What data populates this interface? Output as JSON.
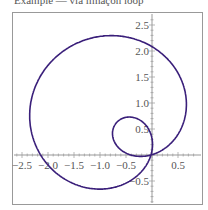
{
  "caption": "Example — via limaçon loop",
  "chart_data": {
    "type": "line",
    "title": "",
    "xlabel": "",
    "ylabel": "",
    "xlim": [
      -2.6,
      0.9
    ],
    "ylim": [
      -1.0,
      2.7
    ],
    "grid": false,
    "x_ticks": [
      -2.5,
      -2.0,
      -1.5,
      -1.0,
      -0.5,
      0.5
    ],
    "y_ticks": [
      0.5,
      1.0,
      1.5,
      2.0,
      2.5,
      -0.5
    ],
    "x_tick_labels": [
      "-2.5",
      "-2.0",
      "-1.5",
      "-1.0",
      "-0.5",
      "0.5"
    ],
    "y_tick_labels": [
      "0.5",
      "1.0",
      "1.5",
      "2.0",
      "2.5",
      "-0.5"
    ],
    "series": [
      {
        "name": "parametric curve",
        "color": "#3a1f7a",
        "description": "Limaçon with inner loop; outer loop spans x≈-2.55..0.6, y≈-0.95..2.6; inner loop near (-0.3, 0.35)"
      }
    ]
  },
  "colors": {
    "curve": "#3a1f7a",
    "axis": "#999999",
    "frame": "#999999",
    "text": "#555555"
  }
}
